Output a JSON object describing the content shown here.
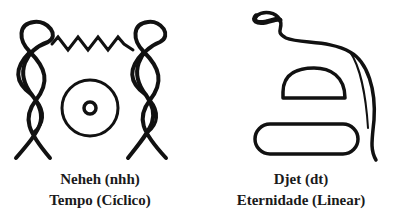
{
  "colors": {
    "ink": "#111111",
    "background": "#ffffff"
  },
  "left": {
    "glyph": "neheh-hieroglyph",
    "name": "Neheh (nhh)",
    "meaning": "Tempo (Cíclico)"
  },
  "right": {
    "glyph": "djet-hieroglyph",
    "name": "Djet (dt)",
    "meaning": "Eternidade (Linear)"
  }
}
